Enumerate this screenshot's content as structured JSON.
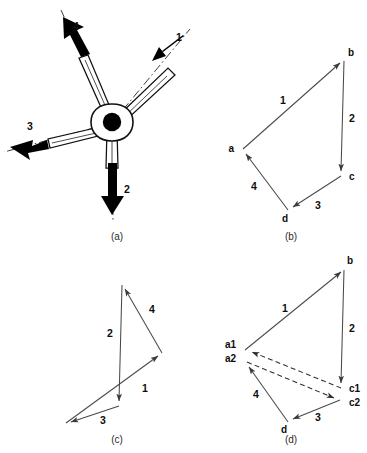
{
  "figure": {
    "background_color": "#ffffff",
    "ink_color": "#111111",
    "line_color": "#4a4a4a"
  },
  "panels": [
    {
      "id": "a",
      "caption": "(a)",
      "type": "space-diagram",
      "description": "Concurrent four-force hub with tapered arms and dash-dot action lines",
      "force_labels": [
        "1",
        "2",
        "3",
        "4"
      ]
    },
    {
      "id": "b",
      "caption": "(b)",
      "type": "force-polygon",
      "closed": true,
      "vertex_labels": [
        "a",
        "b",
        "c",
        "d"
      ],
      "edge_labels": [
        "1",
        "2",
        "3",
        "4"
      ],
      "sequence": "a-b-c-d-a"
    },
    {
      "id": "c",
      "caption": "(c)",
      "type": "force-polygon",
      "closed": true,
      "self_crossing": true,
      "vertex_labels": [],
      "edge_labels": [
        "1",
        "4",
        "2",
        "3"
      ],
      "sequence": "start-1-4-2-3"
    },
    {
      "id": "d",
      "caption": "(d)",
      "type": "force-polygon-open",
      "closed": false,
      "vertex_labels": [
        "a",
        "b",
        "c",
        "a",
        "c",
        "d"
      ],
      "edge_labels": [
        "1",
        "2",
        "3",
        "4"
      ],
      "dashed_closing_lines": 2,
      "sequence": "a-b-c-d-a with closing error vector"
    }
  ],
  "panel_a": {
    "caption": "(a)",
    "hub_center": {
      "x": 112,
      "y": 123
    },
    "arrows": [
      {
        "label": "1",
        "label_x": 179,
        "label_y": 41,
        "angle_deg": -35,
        "direction": "up-right"
      },
      {
        "label": "2",
        "label_x": 127,
        "label_y": 193,
        "angle_deg": 90,
        "direction": "down"
      },
      {
        "label": "3",
        "label_x": 30,
        "label_y": 130,
        "angle_deg": 191,
        "direction": "left-down"
      },
      {
        "label": "4",
        "label_x": 76,
        "label_y": 30,
        "angle_deg": -119,
        "direction": "up-left"
      }
    ]
  },
  "panel_b": {
    "caption": "(b)",
    "vertices": [
      {
        "name": "a",
        "x": 243,
        "y": 149,
        "label_x": 234,
        "label_y": 152
      },
      {
        "name": "b",
        "x": 344,
        "y": 59,
        "label_x": 348,
        "label_y": 56
      },
      {
        "name": "c",
        "x": 341,
        "y": 176,
        "label_x": 349,
        "label_y": 180
      },
      {
        "name": "d",
        "x": 288,
        "y": 210,
        "label_x": 285,
        "label_y": 222
      }
    ],
    "edges": [
      {
        "label": "1",
        "from": "a",
        "to": "b",
        "label_x": 283,
        "label_y": 104
      },
      {
        "label": "2",
        "from": "b",
        "to": "c",
        "label_x": 352,
        "label_y": 122
      },
      {
        "label": "3",
        "from": "c",
        "to": "d",
        "label_x": 318,
        "label_y": 209
      },
      {
        "label": "4",
        "from": "d",
        "to": "a",
        "label_x": 254,
        "label_y": 190
      }
    ]
  },
  "panel_c": {
    "caption": "(c)",
    "points": [
      {
        "name": "p0",
        "x": 66,
        "y": 423
      },
      {
        "name": "p1",
        "x": 162,
        "y": 353
      },
      {
        "name": "p2",
        "x": 122,
        "y": 285
      },
      {
        "name": "p3",
        "x": 119,
        "y": 406
      }
    ],
    "edges": [
      {
        "label": "1",
        "label_x": 145,
        "label_y": 392
      },
      {
        "label": "4",
        "label_x": 152,
        "label_y": 313
      },
      {
        "label": "2",
        "label_x": 110,
        "label_y": 337
      },
      {
        "label": "3",
        "label_x": 103,
        "label_y": 424
      }
    ]
  },
  "panel_d": {
    "caption": "(d)",
    "vertices": [
      {
        "name": "b",
        "x": 344,
        "y": 268,
        "label_x": 347,
        "label_y": 264
      },
      {
        "name": "a1",
        "x": 245,
        "y": 350,
        "label_x": 236,
        "label_y": 348
      },
      {
        "name": "a2",
        "x": 247,
        "y": 362,
        "label_x": 236,
        "label_y": 360
      },
      {
        "name": "c1",
        "x": 341,
        "y": 388,
        "label_x": 349,
        "label_y": 392
      },
      {
        "name": "c2",
        "x": 340,
        "y": 400,
        "label_x": 349,
        "label_y": 404
      },
      {
        "name": "d",
        "x": 288,
        "y": 422,
        "label_x": 284,
        "label_y": 433
      }
    ],
    "edges": [
      {
        "label": "1",
        "label_x": 285,
        "label_y": 312
      },
      {
        "label": "2",
        "label_x": 352,
        "label_y": 332
      },
      {
        "label": "3",
        "label_x": 318,
        "label_y": 421
      },
      {
        "label": "4",
        "label_x": 256,
        "label_y": 398
      }
    ],
    "dashed": [
      {
        "from": "c1",
        "to": "a1",
        "arrow_at": "a1"
      },
      {
        "from": "a2",
        "to": "c2",
        "arrow_at": "c2"
      }
    ]
  }
}
